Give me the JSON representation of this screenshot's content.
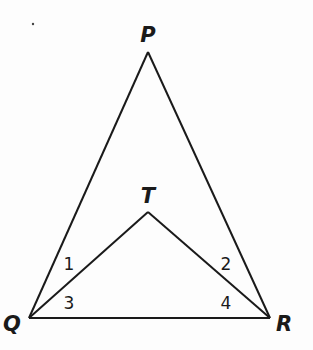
{
  "diagram": {
    "type": "geometry",
    "points": {
      "P": {
        "label": "P",
        "x": 148,
        "y": 52
      },
      "Q": {
        "label": "Q",
        "x": 29,
        "y": 318
      },
      "R": {
        "label": "R",
        "x": 270,
        "y": 318
      },
      "T": {
        "label": "T",
        "x": 148,
        "y": 212
      }
    },
    "segments": [
      {
        "from": "P",
        "to": "Q"
      },
      {
        "from": "P",
        "to": "R"
      },
      {
        "from": "Q",
        "to": "R"
      },
      {
        "from": "Q",
        "to": "T"
      },
      {
        "from": "T",
        "to": "R"
      }
    ],
    "angle_labels": [
      {
        "label": "1",
        "vertex": "Q",
        "between": "PQ and QT"
      },
      {
        "label": "3",
        "vertex": "Q",
        "between": "QT and QR"
      },
      {
        "label": "2",
        "vertex": "R",
        "between": "PR and RT"
      },
      {
        "label": "4",
        "vertex": "R",
        "between": "RT and RQ"
      }
    ],
    "line_color": "#1a1a1a"
  }
}
